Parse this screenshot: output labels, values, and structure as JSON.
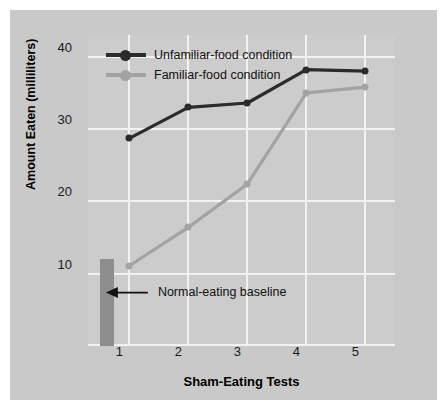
{
  "chart_data": {
    "type": "line",
    "title": "",
    "xlabel": "Sham-Eating Tests",
    "ylabel": "Amount Eaten (milliliters)",
    "x": [
      1,
      2,
      3,
      4,
      5
    ],
    "categories": [
      "1",
      "2",
      "3",
      "4",
      "5"
    ],
    "xlim": [
      0.3,
      5.5
    ],
    "ylim": [
      0,
      43
    ],
    "yticks": [
      10,
      20,
      30,
      40
    ],
    "ytick_labels": [
      "10",
      "20",
      "30",
      "40"
    ],
    "xticks": [
      1,
      2,
      3,
      4,
      5
    ],
    "xtick_labels": [
      "1",
      "2",
      "3",
      "4",
      "5"
    ],
    "grid": true,
    "legend_position": "top-left",
    "series": [
      {
        "name": "Unfamiliar-food condition",
        "color": "#2b2b2b",
        "values": [
          28.7,
          33.0,
          33.6,
          38.2,
          38.0
        ]
      },
      {
        "name": "Familiar-food condition",
        "color": "#a3a3a3",
        "values": [
          11.1,
          16.4,
          22.4,
          35.0,
          35.8
        ]
      }
    ],
    "bars": [
      {
        "name": "Normal-eating baseline",
        "x": 0.62,
        "value": 12.0,
        "color": "#8e8e8e"
      }
    ],
    "annotations": [
      {
        "text": "Normal-eating baseline",
        "arrow": "left-arrow",
        "x": 1.45,
        "y": 6.0
      }
    ]
  },
  "legend": {
    "items": [
      {
        "label": "Unfamiliar-food condition",
        "color": "#2b2b2b",
        "marker": "circle-marker"
      },
      {
        "label": "Familiar-food condition",
        "color": "#a3a3a3",
        "marker": "circle-marker"
      }
    ]
  },
  "axes": {
    "y_title": "Amount Eaten (milliliters)",
    "x_title": "Sham-Eating Tests",
    "y_tick_labels": [
      "40",
      "30",
      "20",
      "10"
    ],
    "x_tick_labels": [
      "1",
      "2",
      "3",
      "4",
      "5"
    ]
  },
  "annotation": {
    "label": "Normal-eating baseline"
  },
  "colors": {
    "page_background": "#ffffff",
    "panel_background": "#c9c9c9",
    "plot_background": "#cccccc",
    "gridline": "#f2f2f2",
    "series_dark": "#2b2b2b",
    "series_light": "#a3a3a3",
    "bar": "#8e8e8e",
    "text": "#111111"
  }
}
